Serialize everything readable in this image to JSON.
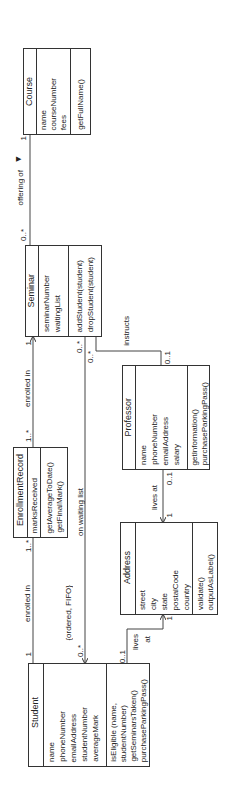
{
  "diagram": {
    "type": "UML class diagram",
    "orientation": "rotated 90 degrees (text reads bottom-to-top)"
  },
  "classes": {
    "course": {
      "name": "Course",
      "attributes": [
        "name",
        "courseNumber",
        "fees"
      ],
      "methods": [
        "getFullName()"
      ]
    },
    "seminar": {
      "name": "Seminar",
      "attributes": [
        "seminarNumber",
        "waitingList"
      ],
      "methods": [
        "addStudent(student)",
        "dropStudent(student)"
      ]
    },
    "enrollment_record": {
      "name": "EnrollmentRecord",
      "attributes": [
        "marksReceived"
      ],
      "methods": [
        "getAverageToDate()",
        "getFinalMark()"
      ]
    },
    "professor": {
      "name": "Professor",
      "attributes": [
        "name",
        "phoneNumber",
        "emailAddress",
        "salary"
      ],
      "methods": [
        "getInformation()",
        "purchaseParkingPass()"
      ]
    },
    "address": {
      "name": "Address",
      "attributes": [
        "street",
        "city",
        "state",
        "postalCode",
        "country"
      ],
      "methods": [
        "validate()",
        "outputAsLabel()"
      ]
    },
    "student": {
      "name": "Student",
      "attributes": [
        "name",
        "phoneNumber",
        "emailAddress",
        "studentNumber",
        "averageMark"
      ],
      "methods": [
        "isEligible (name,",
        "studentNumber)",
        "getSeminarsTaken()",
        "purchaseParkingPass()"
      ]
    }
  },
  "associations": {
    "offering_of": {
      "label": "offering of",
      "direction_glyph": "▶",
      "course_mult": "1",
      "seminar_mult": "0..*"
    },
    "enrolled_in_seminar": {
      "label": "enrolled in",
      "seminar_mult": "1",
      "record_mult": "1..*"
    },
    "enrolled_in_student": {
      "label": "enrolled in",
      "student_mult": "1",
      "record_mult": "1..*"
    },
    "waiting_list": {
      "label": "on waiting list",
      "constraint": "{ordered, FIFO}",
      "seminar_mult": "0..*",
      "student_mult": "0..*"
    },
    "instructs": {
      "label": "instructs",
      "seminar_mult": "0..*",
      "professor_mult": "0..1"
    },
    "professor_lives_at": {
      "label": "lives at",
      "professor_mult": "0..1",
      "address_mult": "1"
    },
    "student_lives_at": {
      "label_line1": "lives",
      "label_line2": "at",
      "student_mult": "0..1",
      "address_mult": "1"
    }
  }
}
